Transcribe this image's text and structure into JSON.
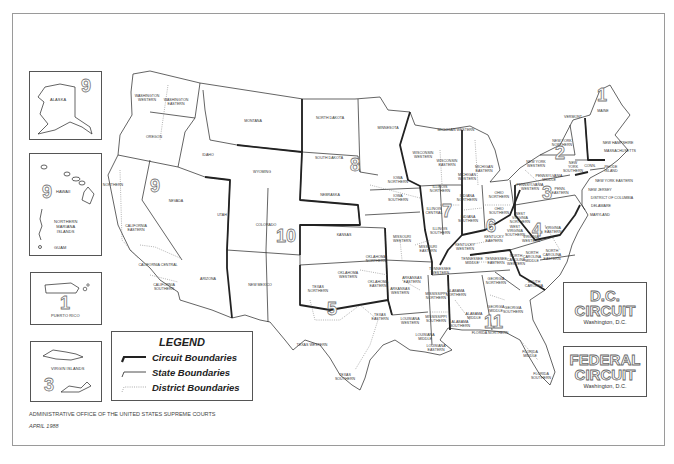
{
  "map": {
    "title_faint": "",
    "states_and_districts": [
      {
        "label": "WASHINGTON\nWESTERN",
        "x": 147,
        "y": 99
      },
      {
        "label": "WASHINGTON\nEASTERN",
        "x": 176,
        "y": 103
      },
      {
        "label": "OREGON",
        "x": 154,
        "y": 138
      },
      {
        "label": "IDAHO",
        "x": 208,
        "y": 156
      },
      {
        "label": "MONTANA",
        "x": 253,
        "y": 122
      },
      {
        "label": "WYOMING",
        "x": 262,
        "y": 173
      },
      {
        "label": "NEVADA",
        "x": 176,
        "y": 202
      },
      {
        "label": "CALIFORNIA\nEASTERN",
        "x": 136,
        "y": 229
      },
      {
        "label": "CALIFORNIA CENTRAL",
        "x": 158,
        "y": 266
      },
      {
        "label": "CALIFORNIA\nSOUTHERN",
        "x": 164,
        "y": 288
      },
      {
        "label": "NORTHERN",
        "x": 113,
        "y": 186
      },
      {
        "label": "UTAH",
        "x": 222,
        "y": 216
      },
      {
        "label": "COLORADO",
        "x": 266,
        "y": 226
      },
      {
        "label": "ARIZONA",
        "x": 208,
        "y": 280
      },
      {
        "label": "NEW MEXICO",
        "x": 260,
        "y": 286
      },
      {
        "label": "NORTH DAKOTA",
        "x": 330,
        "y": 119
      },
      {
        "label": "SOUTH DAKOTA",
        "x": 329,
        "y": 159
      },
      {
        "label": "NEBRASKA",
        "x": 330,
        "y": 196
      },
      {
        "label": "KANSAS",
        "x": 344,
        "y": 236
      },
      {
        "label": "MINNESOTA",
        "x": 388,
        "y": 129
      },
      {
        "label": "IOWA\nNORTHERN",
        "x": 398,
        "y": 181
      },
      {
        "label": "IOWA\nSOUTHERN",
        "x": 398,
        "y": 199
      },
      {
        "label": "MISSOURI\nWESTERN",
        "x": 402,
        "y": 240
      },
      {
        "label": "MISSOURI\nEASTERN",
        "x": 428,
        "y": 250
      },
      {
        "label": "WISCONSIN\nWESTERN",
        "x": 423,
        "y": 156
      },
      {
        "label": "WISCONSIN\nEASTERN",
        "x": 447,
        "y": 164
      },
      {
        "label": "MICHIGAN WESTERN",
        "x": 456,
        "y": 131
      },
      {
        "label": "MICHIGAN\nWESTERN",
        "x": 467,
        "y": 178
      },
      {
        "label": "MICHIGAN\nEASTERN",
        "x": 484,
        "y": 170
      },
      {
        "label": "ILLINOIS\nNORTHERN",
        "x": 440,
        "y": 190
      },
      {
        "label": "ILLINOIS\nCENTRAL",
        "x": 434,
        "y": 212
      },
      {
        "label": "ILLINOIS\nSOUTHERN",
        "x": 440,
        "y": 232
      },
      {
        "label": "INDIANA\nNORTHERN",
        "x": 467,
        "y": 199
      },
      {
        "label": "INDIANA\nSOUTHERN",
        "x": 468,
        "y": 220
      },
      {
        "label": "OHIO\nNORTHERN",
        "x": 499,
        "y": 196
      },
      {
        "label": "OHIO\nSOUTHERN",
        "x": 499,
        "y": 212
      },
      {
        "label": "KENTUCKY\nEASTERN",
        "x": 494,
        "y": 240
      },
      {
        "label": "KENTUCKY\nWESTERN",
        "x": 465,
        "y": 248
      },
      {
        "label": "TENNESSEE\nMIDDLE",
        "x": 472,
        "y": 262
      },
      {
        "label": "TENNESSEE\nEASTERN",
        "x": 496,
        "y": 262
      },
      {
        "label": "TENNESSEE\nWESTERN",
        "x": 440,
        "y": 272
      },
      {
        "label": "ARKANSAS\nEASTERN",
        "x": 412,
        "y": 281
      },
      {
        "label": "ARKANSAS\nWESTERN",
        "x": 400,
        "y": 292
      },
      {
        "label": "OKLAHOMA\nNORTHERN",
        "x": 376,
        "y": 260
      },
      {
        "label": "OKLAHOMA\nWESTERN",
        "x": 348,
        "y": 276
      },
      {
        "label": "OKLAHOMA\nEASTERN",
        "x": 378,
        "y": 285
      },
      {
        "label": "TEXAS\nNORTHERN",
        "x": 318,
        "y": 290
      },
      {
        "label": "TEXAS WESTERN",
        "x": 312,
        "y": 346
      },
      {
        "label": "TEXAS\nEASTERN",
        "x": 380,
        "y": 318
      },
      {
        "label": "TEXAS\nSOUTHERN",
        "x": 345,
        "y": 378
      },
      {
        "label": "LOUISIANA\nWESTERN",
        "x": 410,
        "y": 322
      },
      {
        "label": "LOUISIANA\nMIDDLE",
        "x": 425,
        "y": 338
      },
      {
        "label": "LOUISIANA\nEASTERN",
        "x": 436,
        "y": 349
      },
      {
        "label": "MISSISSIPPI\nNORTHERN",
        "x": 436,
        "y": 297
      },
      {
        "label": "MISSISSIPPI\nSOUTHERN",
        "x": 436,
        "y": 320
      },
      {
        "label": "ALABAMA\nNORTHERN",
        "x": 456,
        "y": 294
      },
      {
        "label": "ALABAMA\nMIDDLE",
        "x": 474,
        "y": 317
      },
      {
        "label": "ALABAMA\nSOUTHERN",
        "x": 460,
        "y": 325
      },
      {
        "label": "GEORGIA\nNORTHERN",
        "x": 496,
        "y": 282
      },
      {
        "label": "GEORGIA\nMIDDLE",
        "x": 496,
        "y": 310
      },
      {
        "label": "GEORGIA\nSOUTHERN",
        "x": 513,
        "y": 311
      },
      {
        "label": "FLORIDA NORTHERN",
        "x": 490,
        "y": 334
      },
      {
        "label": "FLORIDA\nMIDDLE",
        "x": 530,
        "y": 355
      },
      {
        "label": "FLORIDA\nSOUTHERN",
        "x": 541,
        "y": 377
      },
      {
        "label": "SOUTH\nCAROLINA",
        "x": 534,
        "y": 285
      },
      {
        "label": "NORTH\nCAROLINA\nWESTERN",
        "x": 516,
        "y": 261
      },
      {
        "label": "NORTH\nCAROLINA\nMIDDLE",
        "x": 532,
        "y": 258
      },
      {
        "label": "NORTH\nCAROLINA\nEASTERN",
        "x": 552,
        "y": 256
      },
      {
        "label": "VIRGINIA\nWESTERN",
        "x": 531,
        "y": 240
      },
      {
        "label": "VIRGINIA\nEASTERN",
        "x": 553,
        "y": 231
      },
      {
        "label": "WEST\nVIRGINIA\nNORTHERN",
        "x": 520,
        "y": 219
      },
      {
        "label": "WEST\nVIRGINIA\nSOUTHERN",
        "x": 515,
        "y": 232
      },
      {
        "label": "PENNSYLVANIA\nWESTERN",
        "x": 530,
        "y": 188
      },
      {
        "label": "PENNSYLVANIA\nMIDDLE",
        "x": 549,
        "y": 179
      },
      {
        "label": "PENN.\nEASTERN",
        "x": 560,
        "y": 192
      },
      {
        "label": "NEW YORK\nWESTERN",
        "x": 536,
        "y": 165
      },
      {
        "label": "NEW YORK\nNORTHERN",
        "x": 562,
        "y": 144
      },
      {
        "label": "NEW\nYORK\nSOUTHERN",
        "x": 573,
        "y": 168
      },
      {
        "label": "VERMONT",
        "x": 573,
        "y": 118
      },
      {
        "label": "MAINE",
        "x": 603,
        "y": 112
      },
      {
        "label": "NEW HAMPSHIRE",
        "x": 618,
        "y": 144
      },
      {
        "label": "MASSACHUSETTS",
        "x": 620,
        "y": 152
      },
      {
        "label": "CONN.",
        "x": 590,
        "y": 167
      },
      {
        "label": "RHODE\nISLAND",
        "x": 611,
        "y": 170
      },
      {
        "label": "NEW YORK EASTERN",
        "x": 614,
        "y": 182
      },
      {
        "label": "NEW JERSEY",
        "x": 600,
        "y": 191
      },
      {
        "label": "DISTRICT OF COLUMBIA",
        "x": 612,
        "y": 199
      },
      {
        "label": "DELAWARE",
        "x": 601,
        "y": 207
      },
      {
        "label": "MARYLAND",
        "x": 600,
        "y": 216
      }
    ],
    "circuit_numbers": [
      {
        "num": "1",
        "x": 603,
        "y": 95
      },
      {
        "num": "2",
        "x": 561,
        "y": 153
      },
      {
        "num": "3",
        "x": 548,
        "y": 193
      },
      {
        "num": "4",
        "x": 538,
        "y": 230
      },
      {
        "num": "5",
        "x": 333,
        "y": 309
      },
      {
        "num": "6",
        "x": 492,
        "y": 226
      },
      {
        "num": "7",
        "x": 448,
        "y": 211
      },
      {
        "num": "8",
        "x": 356,
        "y": 165
      },
      {
        "num": "9",
        "x": 156,
        "y": 186
      },
      {
        "num": "10",
        "x": 282,
        "y": 236
      },
      {
        "num": "11",
        "x": 490,
        "y": 322
      }
    ]
  },
  "insets": {
    "alaska": {
      "label": "ALASKA",
      "circuit": "9"
    },
    "hawaii": {
      "label": "HAWAII",
      "circuit": "9",
      "sub_labels": [
        "NORTHERN\nMARIANA\nISLANDS",
        "GUAM"
      ]
    },
    "puerto_rico": {
      "label": "PUERTO RICO",
      "circuit": "1"
    },
    "virgin_islands": {
      "label": "VIRGIN ISLANDS",
      "circuit": "3"
    }
  },
  "legend": {
    "title": "LEGEND",
    "items": [
      {
        "label": "Circuit Boundaries",
        "style": "thick"
      },
      {
        "label": "State Boundaries",
        "style": "thin"
      },
      {
        "label": "District Boundaries",
        "style": "dotted"
      }
    ]
  },
  "dc_circuit": {
    "line1": "D.C.",
    "line2": "CIRCUIT",
    "location": "Washington, D.C."
  },
  "federal_circuit": {
    "line1": "FEDERAL",
    "line2": "CIRCUIT",
    "location": "Washington, D.C."
  },
  "footer": {
    "agency": "ADMINISTRATIVE OFFICE OF THE UNITED STATES SUPREME COURTS",
    "date": "APRIL 1988"
  },
  "colors": {
    "line": "#222222",
    "background": "#ffffff",
    "frame": "#9a9a9a"
  }
}
